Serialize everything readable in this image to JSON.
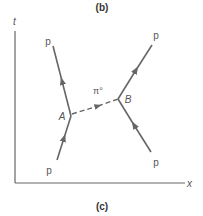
{
  "figure": {
    "top_caption": "(b)",
    "bottom_caption": "(c)"
  },
  "axes": {
    "time_label": "t",
    "space_label": "x"
  },
  "vertices": {
    "a_label": "A",
    "b_label": "B"
  },
  "particles": {
    "incoming_left": "p",
    "outgoing_left": "p",
    "incoming_right": "p",
    "outgoing_right": "p",
    "exchange": "π°"
  },
  "colors": {
    "line": "#666666",
    "text": "#555555"
  }
}
